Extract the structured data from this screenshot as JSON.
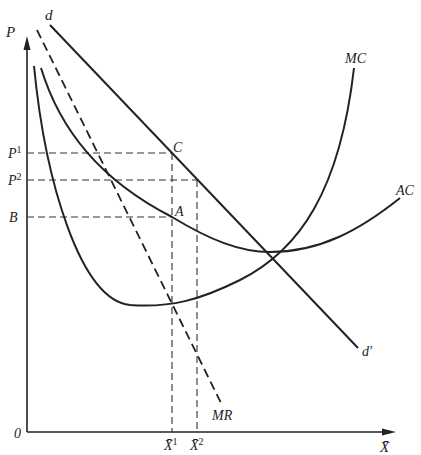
{
  "diagram": {
    "axes": {
      "y_label": "P",
      "x_label": "X̄",
      "origin_label": "0"
    },
    "price_labels": {
      "p1": {
        "base": "P",
        "sup": "1"
      },
      "p2": {
        "base": "P",
        "sup": "2"
      },
      "b": "B"
    },
    "quantity_labels": {
      "x1": {
        "base": "X̄",
        "sup": "1"
      },
      "x2": {
        "base": "X̄",
        "sup": "2"
      }
    },
    "point_labels": {
      "c": "C",
      "a": "A"
    },
    "curve_labels": {
      "demand_top": "d",
      "demand_bottom": "d′",
      "mr": "MR",
      "mc": "MC",
      "ac": "AC"
    }
  }
}
